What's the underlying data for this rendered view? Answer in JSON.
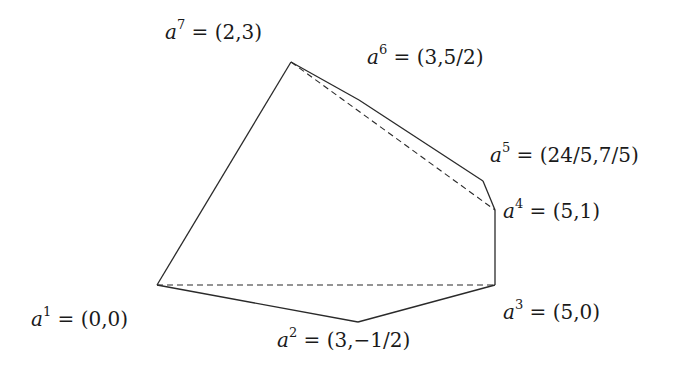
{
  "diagram": {
    "type": "polygon-with-diagonals",
    "scale": {
      "origin_px": [
        157,
        285
      ],
      "px_per_unit_x": 67.6,
      "px_per_unit_y": 74.3
    },
    "vertices": [
      {
        "id": "a1",
        "symbol": "a",
        "index": "1",
        "coords": "(0,0)",
        "x": 0,
        "y": 0,
        "px": [
          157,
          285
        ],
        "label_pos": [
          31,
          309
        ]
      },
      {
        "id": "a2",
        "symbol": "a",
        "index": "2",
        "coords": "(3,−1/2)",
        "x": 3,
        "y": -0.5,
        "px": [
          358,
          322
        ],
        "label_pos": [
          277,
          330
        ]
      },
      {
        "id": "a3",
        "symbol": "a",
        "index": "3",
        "coords": "(5,0)",
        "x": 5,
        "y": 0,
        "px": [
          495,
          285
        ],
        "label_pos": [
          503,
          302
        ]
      },
      {
        "id": "a4",
        "symbol": "a",
        "index": "4",
        "coords": "(5,1)",
        "x": 5,
        "y": 1,
        "px": [
          495,
          210
        ],
        "label_pos": [
          503,
          201
        ]
      },
      {
        "id": "a5",
        "symbol": "a",
        "index": "5",
        "coords": "(24/5,7/5)",
        "x": 4.8,
        "y": 1.4,
        "px": [
          483,
          181
        ],
        "label_pos": [
          490,
          145
        ]
      },
      {
        "id": "a6",
        "symbol": "a",
        "index": "6",
        "coords": "(3,5/2)",
        "x": 3,
        "y": 2.5,
        "px": [
          359,
          100
        ],
        "label_pos": [
          367,
          47
        ]
      },
      {
        "id": "a7",
        "symbol": "a",
        "index": "7",
        "coords": "(2,3)",
        "x": 2,
        "y": 3,
        "px": [
          291,
          62
        ],
        "label_pos": [
          165,
          22
        ]
      }
    ],
    "edges_solid": [
      [
        "a1",
        "a2"
      ],
      [
        "a2",
        "a3"
      ],
      [
        "a3",
        "a4"
      ],
      [
        "a4",
        "a5"
      ],
      [
        "a5",
        "a6"
      ],
      [
        "a6",
        "a7"
      ],
      [
        "a7",
        "a1"
      ]
    ],
    "edges_dashed": [
      [
        "a1",
        "a3"
      ],
      [
        "a7",
        "a4"
      ]
    ],
    "colors": {
      "stroke": "#2a2a2a",
      "text": "#1a1a1a",
      "background": "#ffffff"
    }
  }
}
